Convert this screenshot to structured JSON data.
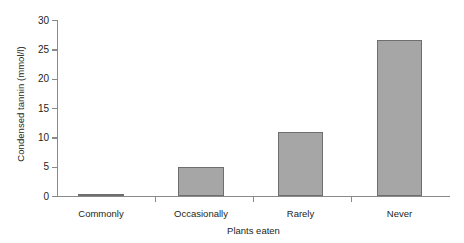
{
  "chart_data": {
    "type": "bar",
    "title": "",
    "subtitle": "",
    "xlabel": "Plants eaten",
    "ylabel": "Condensed tannin (mmol/l)",
    "categories": [
      "Commonly",
      "Occasionally",
      "Rarely",
      "Never"
    ],
    "values": [
      0.4,
      5.0,
      10.9,
      26.6
    ],
    "ylim": [
      0,
      30
    ],
    "yticks": [
      0,
      5,
      10,
      15,
      20,
      25,
      30
    ],
    "ytick_labels": [
      "0",
      "5",
      "10",
      "15",
      "20",
      "25",
      "30"
    ],
    "grid": false,
    "legend": null,
    "annotations": [],
    "colors": {
      "bar_fill": "#a6a6a6",
      "bar_edge": "#6e6e6e",
      "axis": "#8a8a8a",
      "text": "#231f20",
      "background": "#ffffff"
    }
  }
}
